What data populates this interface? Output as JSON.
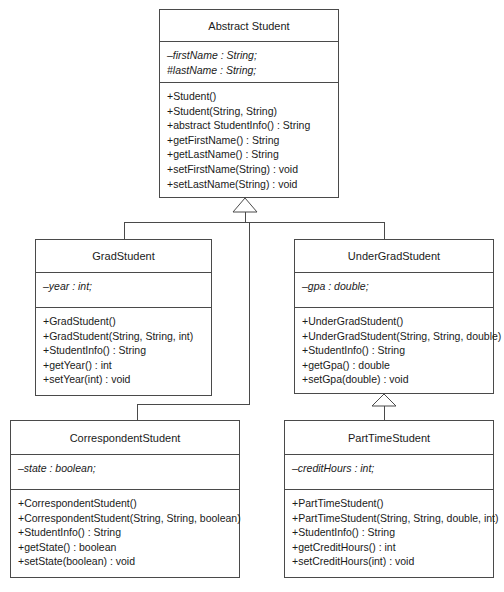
{
  "diagram": {
    "type": "uml-class-diagram",
    "stroke_color": "#4a4a4a",
    "text_color": "#1a1a1a",
    "background_color": "#ffffff"
  },
  "classes": {
    "abstract_student": {
      "name": "Abstract Student",
      "attributes": [
        "–firstName : String;",
        "#lastName : String;"
      ],
      "methods": [
        "+Student()",
        "+Student(String, String)",
        "+abstract StudentInfo() : String",
        "+getFirstName() : String",
        "+getLastName() : String",
        "+setFirstName(String) : void",
        "+setLastName(String) : void"
      ]
    },
    "grad_student": {
      "name": "GradStudent",
      "attributes": [
        "–year : int;"
      ],
      "methods": [
        "+GradStudent()",
        "+GradStudent(String, String, int)",
        "+StudentInfo() : String",
        "+getYear() : int",
        "+setYear(int) : void"
      ]
    },
    "under_grad_student": {
      "name": "UnderGradStudent",
      "attributes": [
        "–gpa : double;"
      ],
      "methods": [
        "+UnderGradStudent()",
        "+UnderGradStudent(String, String, double)",
        "+StudentInfo() : String",
        "+getGpa() : double",
        "+setGpa(double) : void"
      ]
    },
    "correspondent_student": {
      "name": "CorrespondentStudent",
      "attributes": [
        "–state : boolean;"
      ],
      "methods": [
        "+CorrespondentStudent()",
        "+CorrespondentStudent(String, String, boolean)",
        "+StudentInfo() : String",
        "+getState() : boolean",
        "+setState(boolean) : void"
      ]
    },
    "part_time_student": {
      "name": "PartTimeStudent",
      "attributes": [
        "–creditHours : int;"
      ],
      "methods": [
        "+PartTimeStudent()",
        "+PartTimeStudent(String, String, double, int)",
        "+StudentInfo() : String",
        "+getCreditHours() : int",
        "+setCreditHours(int) : void"
      ]
    }
  },
  "relationships": [
    {
      "from": "GradStudent",
      "to": "Abstract Student",
      "kind": "generalization"
    },
    {
      "from": "UnderGradStudent",
      "to": "Abstract Student",
      "kind": "generalization"
    },
    {
      "from": "CorrespondentStudent",
      "to": "Abstract Student",
      "kind": "generalization"
    },
    {
      "from": "PartTimeStudent",
      "to": "UnderGradStudent",
      "kind": "generalization"
    }
  ]
}
